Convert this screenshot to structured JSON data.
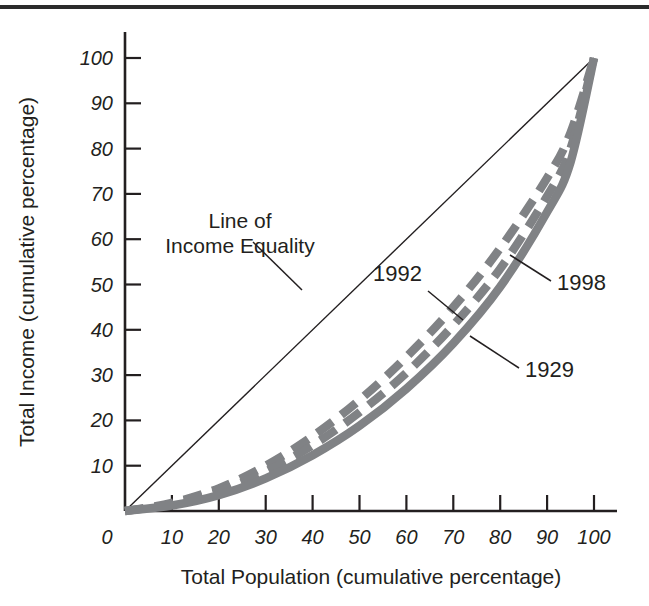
{
  "figure": {
    "background_color": "#ffffff",
    "rule_color": "#2b2b2b",
    "ink_color": "#231f20",
    "curve_color": "#808285"
  },
  "axes": {
    "x_title": "Total Population (cumulative percentage)",
    "y_title": "Total Income (cumulative percentage)",
    "x_ticks": [
      "0",
      "10",
      "20",
      "30",
      "40",
      "50",
      "60",
      "70",
      "80",
      "90",
      "100"
    ],
    "y_ticks": [
      "10",
      "20",
      "30",
      "40",
      "50",
      "60",
      "70",
      "80",
      "90",
      "100"
    ],
    "x_zero_label": "0"
  },
  "annotations": {
    "equality_line_1": "Line of",
    "equality_line_2": "Income Equality",
    "label_1992": "1992",
    "label_1998": "1998",
    "label_1929": "1929"
  },
  "chart_data": {
    "type": "line",
    "title": "",
    "subtitle": "",
    "xlabel": "Total Population (cumulative percentage)",
    "ylabel": "Total Income (cumulative percentage)",
    "xlim": [
      0,
      100
    ],
    "ylim": [
      0,
      100
    ],
    "xticks": [
      0,
      10,
      20,
      30,
      40,
      50,
      60,
      70,
      80,
      90,
      100
    ],
    "yticks": [
      0,
      10,
      20,
      30,
      40,
      50,
      60,
      70,
      80,
      90,
      100
    ],
    "grid": false,
    "legend_position": "inline-annotations",
    "x": [
      0,
      10,
      20,
      30,
      40,
      50,
      60,
      70,
      80,
      90,
      95,
      100
    ],
    "series": [
      {
        "name": "Line of Income Equality",
        "style": "solid-thin",
        "color": "#231f20",
        "values": [
          0,
          10,
          20,
          30,
          40,
          50,
          60,
          70,
          80,
          90,
          95,
          100
        ]
      },
      {
        "name": "1992",
        "style": "dashed",
        "color": "#808285",
        "values": [
          0,
          1.8,
          5.0,
          10.0,
          16.5,
          24.5,
          34.0,
          45.0,
          58.0,
          73.5,
          83.5,
          100
        ]
      },
      {
        "name": "1998",
        "style": "dashed",
        "color": "#808285",
        "values": [
          0,
          1.5,
          4.3,
          8.7,
          14.5,
          21.8,
          30.5,
          41.0,
          53.5,
          69.5,
          80.0,
          100
        ]
      },
      {
        "name": "1929",
        "style": "solid-thick",
        "color": "#808285",
        "values": [
          0,
          1.2,
          3.5,
          7.2,
          12.3,
          18.8,
          27.0,
          37.0,
          49.5,
          66.0,
          77.0,
          100
        ]
      }
    ]
  }
}
